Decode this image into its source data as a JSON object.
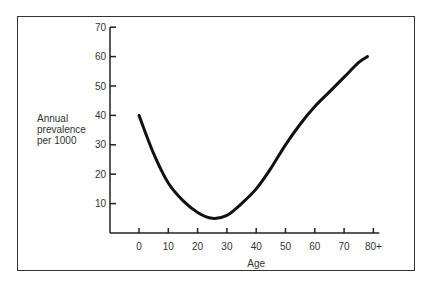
{
  "chart_data": {
    "type": "line",
    "title": "",
    "xlabel": "Age",
    "ylabel": "Annual prevalence per 1000",
    "ylabel_lines": [
      "Annual",
      "prevalence",
      "per 1000"
    ],
    "x_ticks": [
      "0",
      "10",
      "20",
      "30",
      "40",
      "50",
      "60",
      "70",
      "80+"
    ],
    "y_ticks": [
      "10",
      "20",
      "30",
      "40",
      "50",
      "60",
      "70"
    ],
    "xlim": [
      -10,
      85
    ],
    "ylim": [
      0,
      70
    ],
    "grid": false,
    "legend": null,
    "series": [
      {
        "name": "Annual prevalence per 1000",
        "x": [
          0,
          5,
          10,
          15,
          20,
          25,
          30,
          35,
          40,
          45,
          50,
          55,
          60,
          65,
          70,
          75,
          78
        ],
        "y": [
          40,
          27,
          17,
          11,
          7,
          5,
          6,
          10,
          15,
          22,
          30,
          37,
          43,
          48,
          53,
          58,
          60
        ]
      }
    ]
  }
}
